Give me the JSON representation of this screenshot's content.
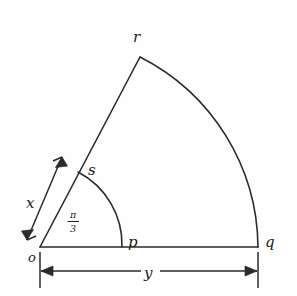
{
  "figure": {
    "type": "geometry-diagram",
    "background_color": "#fefefe",
    "line_color": "#2b2b2b"
  },
  "points": {
    "origin": {
      "label": "o",
      "x": 40,
      "y": 247
    },
    "p": {
      "label": "p",
      "x": 122,
      "y": 247
    },
    "q": {
      "label": "q",
      "x": 258,
      "y": 247
    },
    "r": {
      "label": "r",
      "x": 140,
      "y": 57
    },
    "s": {
      "label": "s",
      "x": 78,
      "y": 172
    }
  },
  "labels": {
    "o": "o",
    "p": "p",
    "q": "q",
    "r": "r",
    "s": "s",
    "x": "x",
    "y": "y",
    "angle_numerator": "π",
    "angle_denominator": "3"
  },
  "geometry": {
    "angle_value": "π/3",
    "angle_degrees": 60,
    "inner_radius_label": "x",
    "outer_extent_label": "y",
    "baseline_from": "o",
    "baseline_to": "q",
    "outer_arc_from": "r",
    "outer_arc_to": "q",
    "inner_arc_from": "s",
    "inner_arc_to": "p"
  },
  "dimensions": {
    "x": {
      "label": "x",
      "measures": "segment o to s",
      "arrow_style": "double-headed",
      "label_x": 31,
      "label_y": 203
    },
    "y": {
      "label": "y",
      "measures": "segment o to q",
      "arrow_style": "double-headed-with-ticks",
      "label_x": 149,
      "label_y": 278
    }
  },
  "canvas": {
    "width": 297,
    "height": 296
  }
}
